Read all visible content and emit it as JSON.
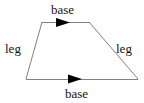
{
  "figure": {
    "name": "trapezoid",
    "background_color": "#ffffff",
    "stroke_color": "#808080",
    "stroke_width": 1,
    "arrow_color": "#000000",
    "text_color": "#141414",
    "vertices": {
      "top_left": [
        42,
        22
      ],
      "top_right": [
        89,
        22
      ],
      "bottom_right": [
        138,
        79
      ],
      "bottom_left": [
        26,
        79
      ]
    },
    "sides": [
      {
        "name": "top-base",
        "label": "base",
        "from": "top_left",
        "to": "top_right",
        "has_arrow_marker": true,
        "arrow_direction": "right"
      },
      {
        "name": "right-leg",
        "label": "leg",
        "from": "top_right",
        "to": "bottom_right",
        "has_arrow_marker": false
      },
      {
        "name": "bottom-base",
        "label": "base",
        "from": "bottom_left",
        "to": "bottom_right",
        "has_arrow_marker": true,
        "arrow_direction": "right"
      },
      {
        "name": "left-leg",
        "label": "leg",
        "from": "bottom_left",
        "to": "top_left",
        "has_arrow_marker": false
      }
    ],
    "arrow_markers": [
      {
        "name": "top-base-arrow",
        "points": "56,18 70,22.5 56,27",
        "on_side": "top-base"
      },
      {
        "name": "bottom-base-arrow",
        "points": "68,74.5 82,79 68,83.5",
        "on_side": "bottom-base"
      }
    ]
  },
  "labels": {
    "base_top": "base",
    "base_bottom": "base",
    "leg_left": "leg",
    "leg_right": "leg"
  }
}
